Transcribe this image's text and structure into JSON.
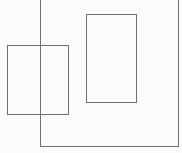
{
  "diagram": {
    "background": "#fbfbfb",
    "stroke": "#6f6f6f",
    "shapes": [
      {
        "id": "outer-frame",
        "type": "rect",
        "x": 40,
        "y": -2,
        "width": 139,
        "height": 149,
        "open_top": true
      },
      {
        "id": "left-box",
        "type": "rect",
        "x": 7,
        "y": 45,
        "width": 62,
        "height": 70
      },
      {
        "id": "right-box",
        "type": "rect",
        "x": 86,
        "y": 14,
        "width": 51,
        "height": 89
      }
    ]
  }
}
